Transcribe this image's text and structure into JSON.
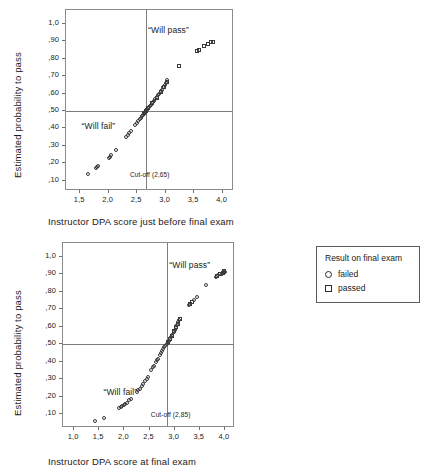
{
  "legend": {
    "title": "Result on final exam",
    "entries": [
      {
        "symbol": "circle-marker-icon",
        "label": "failed"
      },
      {
        "symbol": "square-marker-icon",
        "label": "passed"
      }
    ]
  },
  "chart_data": [
    {
      "id": "chart-top",
      "type": "scatter",
      "title": "",
      "xlabel": "Instructor DPA score just before final exam",
      "ylabel": "Estimated probability to pass",
      "xlim": [
        1.25,
        4.2
      ],
      "ylim": [
        0.04,
        1.08
      ],
      "xticks": [
        1.5,
        2.0,
        2.5,
        3.0,
        3.5,
        4.0
      ],
      "xticklabels": [
        "1,5",
        "2,0",
        "2,5",
        "3,0",
        "3,5",
        "4,0"
      ],
      "yticks": [
        0.1,
        0.2,
        0.3,
        0.4,
        0.5,
        0.6,
        0.7,
        0.8,
        0.9,
        1.0
      ],
      "yticklabels": [
        ",10",
        ",20",
        ",30",
        ",40",
        ",50",
        ",60",
        ",70",
        ",80",
        ",90",
        "1,0"
      ],
      "grid": false,
      "annotations": [
        {
          "text": "“Will pass”",
          "x": 3.05,
          "y": 0.965,
          "size": "normal"
        },
        {
          "text": "“Will fail”",
          "x": 1.82,
          "y": 0.415,
          "size": "normal"
        },
        {
          "text": "Cut-off (2,65)",
          "x": 2.72,
          "y": 0.125,
          "size": "small"
        }
      ],
      "reflines": {
        "hline": 0.5,
        "vline": 2.65
      },
      "series": [
        {
          "name": "failed",
          "marker": "circle",
          "points": [
            [
              1.63,
              0.135
            ],
            [
              1.77,
              0.17
            ],
            [
              1.8,
              0.178
            ],
            [
              1.82,
              0.182
            ],
            [
              2.0,
              0.228
            ],
            [
              2.02,
              0.238
            ],
            [
              2.04,
              0.245
            ],
            [
              2.13,
              0.277
            ],
            [
              2.3,
              0.35
            ],
            [
              2.33,
              0.362
            ],
            [
              2.36,
              0.372
            ],
            [
              2.39,
              0.385
            ],
            [
              2.46,
              0.42
            ],
            [
              2.49,
              0.432
            ],
            [
              2.52,
              0.443
            ],
            [
              2.55,
              0.455
            ],
            [
              2.57,
              0.462
            ],
            [
              2.59,
              0.47
            ],
            [
              2.6,
              0.477
            ],
            [
              2.62,
              0.485
            ],
            [
              2.63,
              0.49
            ],
            [
              2.64,
              0.494
            ],
            [
              2.66,
              0.503
            ],
            [
              2.67,
              0.508
            ],
            [
              2.68,
              0.512
            ],
            [
              2.7,
              0.52
            ],
            [
              2.72,
              0.528
            ],
            [
              2.74,
              0.535
            ],
            [
              2.78,
              0.552
            ],
            [
              2.8,
              0.56
            ],
            [
              2.82,
              0.568
            ],
            [
              2.85,
              0.58
            ],
            [
              2.87,
              0.59
            ],
            [
              2.89,
              0.598
            ],
            [
              2.92,
              0.612
            ],
            [
              2.94,
              0.622
            ],
            [
              2.96,
              0.635
            ],
            [
              2.99,
              0.65
            ],
            [
              3.01,
              0.662
            ],
            [
              3.03,
              0.675
            ]
          ]
        },
        {
          "name": "passed",
          "marker": "square",
          "points": [
            [
              2.62,
              0.488
            ],
            [
              2.65,
              0.498
            ],
            [
              2.69,
              0.515
            ],
            [
              2.76,
              0.545
            ],
            [
              2.84,
              0.576
            ],
            [
              2.91,
              0.608
            ],
            [
              2.97,
              0.64
            ],
            [
              3.02,
              0.668
            ],
            [
              3.24,
              0.757
            ],
            [
              3.55,
              0.845
            ],
            [
              3.58,
              0.848
            ],
            [
              3.67,
              0.872
            ],
            [
              3.74,
              0.882
            ],
            [
              3.8,
              0.895
            ],
            [
              3.83,
              0.898
            ]
          ]
        }
      ]
    },
    {
      "id": "chart-bottom",
      "type": "scatter",
      "title": "",
      "xlabel": "Instructor DPA score at final exam",
      "ylabel": "Estimated probability to pass",
      "xlim": [
        0.78,
        4.2
      ],
      "ylim": [
        0.02,
        1.08
      ],
      "xticks": [
        1.0,
        1.5,
        2.0,
        2.5,
        3.0,
        3.5,
        4.0
      ],
      "xticklabels": [
        "1,0",
        "1,5",
        "2,0",
        "2,5",
        "3,0",
        "3,5",
        "4,0"
      ],
      "yticks": [
        0.1,
        0.2,
        0.3,
        0.4,
        0.5,
        0.6,
        0.7,
        0.8,
        0.9,
        1.0
      ],
      "yticklabels": [
        ",10",
        ",20",
        ",30",
        ",40",
        ",50",
        ",60",
        ",70",
        ",80",
        ",90",
        "1,0"
      ],
      "grid": false,
      "annotations": [
        {
          "text": "“Will pass”",
          "x": 3.3,
          "y": 0.955,
          "size": "normal"
        },
        {
          "text": "“Will fail”",
          "x": 1.92,
          "y": 0.228,
          "size": "normal"
        },
        {
          "text": "Cut-off (2,85)",
          "x": 2.92,
          "y": 0.088,
          "size": "small"
        }
      ],
      "reflines": {
        "hline": 0.5,
        "vline": 2.85
      },
      "series": [
        {
          "name": "failed",
          "marker": "circle",
          "points": [
            [
              1.41,
              0.058
            ],
            [
              1.6,
              0.078
            ],
            [
              1.9,
              0.135
            ],
            [
              1.93,
              0.14
            ],
            [
              1.96,
              0.145
            ],
            [
              1.99,
              0.15
            ],
            [
              2.02,
              0.155
            ],
            [
              2.05,
              0.162
            ],
            [
              2.1,
              0.178
            ],
            [
              2.13,
              0.185
            ],
            [
              2.25,
              0.228
            ],
            [
              2.28,
              0.238
            ],
            [
              2.31,
              0.245
            ],
            [
              2.35,
              0.262
            ],
            [
              2.38,
              0.272
            ],
            [
              2.42,
              0.29
            ],
            [
              2.45,
              0.302
            ],
            [
              2.47,
              0.312
            ],
            [
              2.53,
              0.355
            ],
            [
              2.56,
              0.368
            ],
            [
              2.58,
              0.378
            ],
            [
              2.62,
              0.398
            ],
            [
              2.64,
              0.408
            ],
            [
              2.66,
              0.418
            ],
            [
              2.7,
              0.44
            ],
            [
              2.72,
              0.45
            ],
            [
              2.74,
              0.46
            ],
            [
              2.77,
              0.472
            ],
            [
              2.79,
              0.482
            ],
            [
              2.81,
              0.49
            ],
            [
              2.84,
              0.5
            ],
            [
              2.86,
              0.508
            ],
            [
              2.88,
              0.518
            ],
            [
              2.91,
              0.532
            ],
            [
              2.93,
              0.542
            ],
            [
              2.95,
              0.552
            ],
            [
              2.98,
              0.57
            ],
            [
              3.0,
              0.582
            ],
            [
              3.02,
              0.595
            ],
            [
              3.05,
              0.612
            ],
            [
              3.07,
              0.625
            ],
            [
              3.09,
              0.64
            ],
            [
              3.28,
              0.725
            ],
            [
              3.31,
              0.733
            ],
            [
              3.38,
              0.752
            ],
            [
              3.45,
              0.772
            ],
            [
              3.62,
              0.838
            ],
            [
              3.82,
              0.888
            ],
            [
              3.86,
              0.895
            ],
            [
              3.94,
              0.905
            ],
            [
              3.97,
              0.912
            ],
            [
              4.0,
              0.915
            ]
          ]
        },
        {
          "name": "passed",
          "marker": "square",
          "points": [
            [
              2.86,
              0.51
            ],
            [
              2.9,
              0.528
            ],
            [
              2.94,
              0.548
            ],
            [
              2.99,
              0.575
            ],
            [
              3.03,
              0.598
            ],
            [
              3.06,
              0.618
            ],
            [
              3.1,
              0.645
            ],
            [
              3.3,
              0.73
            ],
            [
              3.34,
              0.742
            ],
            [
              3.85,
              0.892
            ],
            [
              3.9,
              0.9
            ],
            [
              3.96,
              0.91
            ],
            [
              3.99,
              0.918
            ]
          ]
        }
      ]
    }
  ]
}
